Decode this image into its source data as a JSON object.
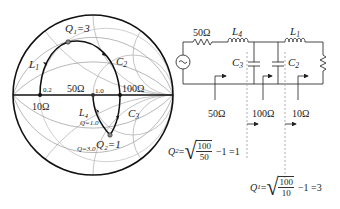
{
  "smith_chart": {
    "labels": {
      "q1_point": "Q₁=3",
      "q2_point": "Q₂=1",
      "q_curve_1": "Q=1.0",
      "q_curve_3": "Q=3.0",
      "r_02": "0.2",
      "r_10": "1.0",
      "imp_50": "50Ω",
      "imp_100": "100Ω",
      "imp_10": "10Ω",
      "l1": "L",
      "l1_sub": "1",
      "c2": "C",
      "c2_sub": "2",
      "l4": "L",
      "l4_sub": "4",
      "c3": "C",
      "c3_sub": "3"
    }
  },
  "circuit": {
    "source_resistor": "50Ω",
    "l4": "L",
    "l4_sub": "4",
    "l1": "L",
    "l1_sub": "1",
    "c3": "C",
    "c3_sub": "3",
    "c2": "C",
    "c2_sub": "2",
    "ref_50": "50Ω",
    "ref_100": "100Ω",
    "ref_10": "10Ω"
  },
  "formulas": {
    "q2": {
      "lhs": "Q",
      "lhs_sub": "2",
      "eq": "=",
      "num": "100",
      "den": "50",
      "tail": "−1 =1"
    },
    "q1": {
      "lhs": "Q",
      "lhs_sub": "1",
      "eq": "=",
      "num": "100",
      "den": "10",
      "tail": "−1 =3"
    }
  }
}
